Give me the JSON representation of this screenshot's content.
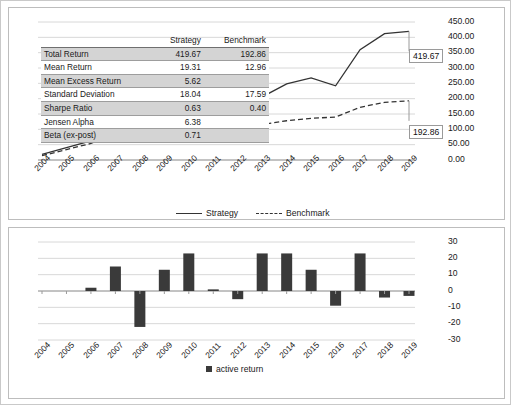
{
  "stats_table": {
    "columns": [
      "",
      "Strategy",
      "Benchmark"
    ],
    "rows": [
      {
        "label": "Total Return",
        "strategy": "419.67",
        "benchmark": "192.86"
      },
      {
        "label": "Mean Return",
        "strategy": "19.31",
        "benchmark": "12.96"
      },
      {
        "label": "Mean Excess Return",
        "strategy": "5.62",
        "benchmark": ""
      },
      {
        "label": "Standard Deviation",
        "strategy": "18.04",
        "benchmark": "17.59"
      },
      {
        "label": "Sharpe Ratio",
        "strategy": "0.63",
        "benchmark": "0.40"
      },
      {
        "label": "Jensen Alpha",
        "strategy": "6.38",
        "benchmark": ""
      },
      {
        "label": "Beta (ex-post)",
        "strategy": "0.71",
        "benchmark": ""
      }
    ]
  },
  "callouts": {
    "strategy_end": "419.67",
    "benchmark_end": "192.86"
  },
  "chart_data": [
    {
      "type": "line",
      "title": "",
      "xlabel": "",
      "ylabel": "",
      "grid": true,
      "legend_position": "bottom",
      "x": [
        "2004",
        "2005",
        "2006",
        "2007",
        "2008",
        "2009",
        "2010",
        "2011",
        "2012",
        "2013",
        "2014",
        "2015",
        "2016",
        "2017",
        "2018",
        "2019"
      ],
      "ylim": [
        0,
        450
      ],
      "yticks": [
        "0.00",
        "50.00",
        "100.00",
        "150.00",
        "200.00",
        "250.00",
        "300.00",
        "350.00",
        "400.00",
        "450.00"
      ],
      "series": [
        {
          "name": "Strategy",
          "style": "solid",
          "values": [
            18,
            40,
            62,
            104,
            74,
            58,
            96,
            112,
            128,
            206,
            248,
            268,
            242,
            360,
            412,
            419.67
          ]
        },
        {
          "name": "Benchmark",
          "style": "dashed",
          "values": [
            14,
            34,
            54,
            92,
            70,
            58,
            82,
            84,
            92,
            116,
            128,
            136,
            140,
            172,
            188,
            192.86
          ]
        }
      ]
    },
    {
      "type": "bar",
      "title": "",
      "xlabel": "",
      "ylabel": "",
      "grid": true,
      "legend_position": "bottom",
      "categories": [
        "2004",
        "2005",
        "2006",
        "2007",
        "2008",
        "2009",
        "2010",
        "2011",
        "2012",
        "2013",
        "2014",
        "2015",
        "2016",
        "2017",
        "2018",
        "2019"
      ],
      "ylim": [
        -30,
        30
      ],
      "yticks": [
        "30",
        "20",
        "10",
        "0",
        "-10",
        "-20",
        "-30"
      ],
      "series": [
        {
          "name": "active return",
          "values": [
            0,
            0,
            2,
            15,
            -22,
            13,
            23,
            1,
            -5,
            23,
            23,
            13,
            -9,
            23,
            -4,
            -3
          ]
        }
      ]
    }
  ],
  "legends": {
    "top": [
      {
        "label": "Strategy",
        "style": "solid"
      },
      {
        "label": "Benchmark",
        "style": "dashed"
      }
    ],
    "bottom": [
      {
        "label": "active return",
        "style": "square"
      }
    ]
  },
  "colors": {
    "line": "#333333",
    "bar": "#3a3a3a",
    "grid": "#d8d8d8",
    "panel_border": "#bdbdbd",
    "table_shade": "#d4d4d4"
  }
}
